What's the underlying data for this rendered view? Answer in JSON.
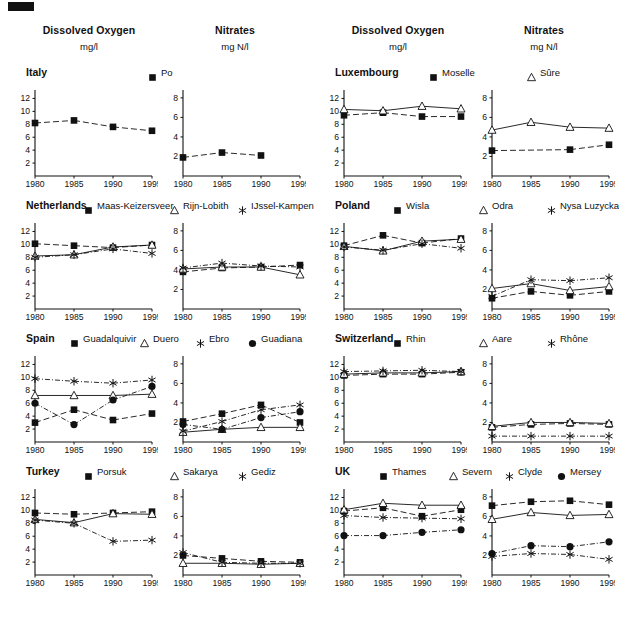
{
  "figure": {
    "corner_mark": "black-bar",
    "x_ticks": [
      "1980",
      "1985",
      "1990",
      "1995"
    ],
    "x_values": [
      1980,
      1985,
      1990,
      1995
    ],
    "do_y_ticks": [
      "2",
      "4",
      "6",
      "8",
      "10",
      "12"
    ],
    "nitrate_y_ticks": [
      "2",
      "4",
      "6",
      "8"
    ]
  },
  "columns": [
    {
      "id": "left",
      "headers": [
        {
          "title": "Dissolved Oxygen",
          "unit": "mg/l"
        },
        {
          "title": "Nitrates",
          "unit": "mg N/l"
        }
      ]
    },
    {
      "id": "right",
      "headers": [
        {
          "title": "Dissolved Oxygen",
          "unit": "mg/l"
        },
        {
          "title": "Nitrates",
          "unit": "mg N/l"
        }
      ]
    }
  ],
  "chart_data": {
    "type": "line",
    "xlabel": "",
    "x": [
      1980,
      1985,
      1990,
      1995
    ],
    "grid": false,
    "legend_position": "top",
    "panels": [
      {
        "country": "Italy",
        "column": "left",
        "row": 0,
        "series_names": [
          "Po"
        ],
        "markers": [
          "square"
        ],
        "dissolved_oxygen": {
          "ylabel": "mg/l",
          "ylim": [
            0,
            13
          ],
          "series": [
            {
              "name": "Po",
              "marker": "square",
              "values": [
                8.2,
                8.6,
                7.6,
                7.0
              ]
            }
          ]
        },
        "nitrates": {
          "ylabel": "mg N/l",
          "ylim": [
            0,
            8.6
          ],
          "series": [
            {
              "name": "Po",
              "marker": "square",
              "values": [
                1.9,
                2.4,
                2.1,
                null
              ]
            }
          ]
        }
      },
      {
        "country": "Netherlands",
        "column": "left",
        "row": 1,
        "series_names": [
          "Maas-Keizersveer",
          "Rijn-Lobith",
          "IJssel-Kampen"
        ],
        "markers": [
          "square",
          "triangle",
          "star"
        ],
        "dissolved_oxygen": {
          "ylabel": "mg/l",
          "ylim": [
            0,
            13
          ],
          "series": [
            {
              "name": "Maas-Keizersveer",
              "marker": "square",
              "values": [
                10.1,
                9.8,
                9.5,
                9.9
              ]
            },
            {
              "name": "Rijn-Lobith",
              "marker": "triangle",
              "values": [
                8.2,
                8.4,
                9.6,
                9.9
              ]
            },
            {
              "name": "IJssel-Kampen",
              "marker": "star",
              "values": [
                8.0,
                8.4,
                9.3,
                8.6
              ]
            }
          ]
        },
        "nitrates": {
          "ylabel": "mg N/l",
          "ylim": [
            0,
            8.6
          ],
          "series": [
            {
              "name": "Maas-Keizersveer",
              "marker": "square",
              "values": [
                3.8,
                4.2,
                4.3,
                4.5
              ]
            },
            {
              "name": "Rijn-Lobith",
              "marker": "triangle",
              "values": [
                4.1,
                4.3,
                4.3,
                3.5
              ]
            },
            {
              "name": "IJssel-Kampen",
              "marker": "star",
              "values": [
                4.2,
                4.7,
                4.4,
                4.3
              ]
            }
          ]
        }
      },
      {
        "country": "Spain",
        "column": "left",
        "row": 2,
        "series_names": [
          "Guadalquivir",
          "Duero",
          "Ebro",
          "Guadiana"
        ],
        "markers": [
          "square",
          "triangle",
          "star",
          "circle"
        ],
        "dissolved_oxygen": {
          "ylabel": "mg/l",
          "ylim": [
            0,
            13
          ],
          "series": [
            {
              "name": "Guadalquivir",
              "marker": "square",
              "values": [
                3.0,
                5.0,
                3.4,
                4.4
              ]
            },
            {
              "name": "Duero",
              "marker": "triangle",
              "values": [
                7.2,
                7.2,
                7.2,
                7.4
              ]
            },
            {
              "name": "Ebro",
              "marker": "star",
              "values": [
                9.8,
                9.4,
                9.1,
                9.6
              ]
            },
            {
              "name": "Guadiana",
              "marker": "circle",
              "values": [
                6.0,
                2.7,
                6.5,
                8.6
              ]
            }
          ]
        },
        "nitrates": {
          "ylabel": "mg N/l",
          "ylim": [
            0,
            8.6
          ],
          "series": [
            {
              "name": "Guadalquivir",
              "marker": "square",
              "values": [
                2.1,
                2.9,
                3.8,
                2.0
              ]
            },
            {
              "name": "Duero",
              "marker": "triangle",
              "values": [
                1.0,
                1.3,
                1.5,
                1.5
              ]
            },
            {
              "name": "Ebro",
              "marker": "star",
              "values": [
                1.1,
                2.1,
                3.3,
                3.8
              ]
            },
            {
              "name": "Guadiana",
              "marker": "circle",
              "values": [
                1.8,
                1.3,
                2.5,
                3.1
              ]
            }
          ]
        }
      },
      {
        "country": "Turkey",
        "column": "left",
        "row": 3,
        "series_names": [
          "Porsuk",
          "Sakarya",
          "Gediz"
        ],
        "markers": [
          "square",
          "triangle",
          "star"
        ],
        "dissolved_oxygen": {
          "ylabel": "mg/l",
          "ylim": [
            0,
            13
          ],
          "series": [
            {
              "name": "Porsuk",
              "marker": "square",
              "values": [
                9.6,
                9.4,
                9.6,
                9.8
              ]
            },
            {
              "name": "Sakarya",
              "marker": "triangle",
              "values": [
                8.6,
                8.1,
                9.5,
                9.4
              ]
            },
            {
              "name": "Gediz",
              "marker": "star",
              "values": [
                8.5,
                8.0,
                5.2,
                5.4
              ]
            }
          ]
        },
        "nitrates": {
          "ylabel": "mg N/l",
          "ylim": [
            0,
            8.6
          ],
          "series": [
            {
              "name": "Porsuk",
              "marker": "square",
              "values": [
                2.0,
                1.7,
                1.4,
                1.3
              ]
            },
            {
              "name": "Sakarya",
              "marker": "triangle",
              "values": [
                1.2,
                1.2,
                1.1,
                1.2
              ]
            },
            {
              "name": "Gediz",
              "marker": "star",
              "values": [
                2.3,
                1.3,
                1.2,
                1.2
              ]
            }
          ]
        }
      },
      {
        "country": "Luxembourg",
        "column": "right",
        "row": 0,
        "series_names": [
          "Moselle",
          "Sûre"
        ],
        "markers": [
          "square",
          "triangle"
        ],
        "dissolved_oxygen": {
          "ylabel": "mg/l",
          "ylim": [
            0,
            13
          ],
          "series": [
            {
              "name": "Moselle",
              "marker": "square",
              "values": [
                9.4,
                9.8,
                9.2,
                9.2
              ]
            },
            {
              "name": "Sûre",
              "marker": "triangle",
              "values": [
                10.3,
                10.1,
                10.8,
                10.4
              ]
            }
          ]
        },
        "nitrates": {
          "ylabel": "mg N/l",
          "ylim": [
            0,
            8.6
          ],
          "series": [
            {
              "name": "Moselle",
              "marker": "square",
              "values": [
                2.6,
                null,
                2.7,
                3.2
              ]
            },
            {
              "name": "Sûre",
              "marker": "triangle",
              "values": [
                4.7,
                5.5,
                5.0,
                4.9
              ]
            }
          ]
        }
      },
      {
        "country": "Poland",
        "column": "right",
        "row": 1,
        "series_names": [
          "Wisla",
          "Odra",
          "Nysa Luzycka"
        ],
        "markers": [
          "square",
          "triangle",
          "star"
        ],
        "dissolved_oxygen": {
          "ylabel": "mg/l",
          "ylim": [
            0,
            13
          ],
          "series": [
            {
              "name": "Wisla",
              "marker": "square",
              "values": [
                9.8,
                11.4,
                10.2,
                10.9
              ]
            },
            {
              "name": "Odra",
              "marker": "triangle",
              "values": [
                9.7,
                9.0,
                10.5,
                10.8
              ]
            },
            {
              "name": "Nysa Luzycka",
              "marker": "star",
              "values": [
                9.6,
                9.1,
                10.1,
                9.4
              ]
            }
          ]
        },
        "nitrates": {
          "ylabel": "mg N/l",
          "ylim": [
            0,
            8.6
          ],
          "series": [
            {
              "name": "Wisla",
              "marker": "square",
              "values": [
                1.1,
                1.8,
                1.4,
                1.8
              ]
            },
            {
              "name": "Odra",
              "marker": "triangle",
              "values": [
                2.1,
                2.6,
                1.9,
                2.3
              ]
            },
            {
              "name": "Nysa Luzycka",
              "marker": "star",
              "values": [
                1.3,
                3.0,
                2.9,
                3.2
              ]
            }
          ]
        }
      },
      {
        "country": "Switzerland",
        "column": "right",
        "row": 2,
        "series_names": [
          "Rhin",
          "Aare",
          "Rhône"
        ],
        "markers": [
          "square",
          "triangle",
          "star"
        ],
        "dissolved_oxygen": {
          "ylabel": "mg/l",
          "ylim": [
            0,
            13
          ],
          "series": [
            {
              "name": "Rhin",
              "marker": "square",
              "values": [
                10.3,
                10.5,
                10.5,
                10.8
              ]
            },
            {
              "name": "Aare",
              "marker": "triangle",
              "values": [
                10.5,
                10.7,
                10.7,
                10.9
              ]
            },
            {
              "name": "Rhône",
              "marker": "star",
              "values": [
                10.9,
                11.0,
                11.1,
                10.9
              ]
            }
          ]
        },
        "nitrates": {
          "ylabel": "mg N/l",
          "ylim": [
            0,
            8.6
          ],
          "series": [
            {
              "name": "Rhin",
              "marker": "square",
              "values": [
                1.5,
                1.8,
                1.9,
                1.8
              ]
            },
            {
              "name": "Aare",
              "marker": "triangle",
              "values": [
                1.6,
                2.0,
                2.0,
                1.9
              ]
            },
            {
              "name": "Rhône",
              "marker": "star",
              "values": [
                0.6,
                0.6,
                0.6,
                0.6
              ]
            }
          ]
        }
      },
      {
        "country": "UK",
        "column": "right",
        "row": 3,
        "series_names": [
          "Thames",
          "Severn",
          "Clyde",
          "Mersey"
        ],
        "markers": [
          "square",
          "triangle",
          "star",
          "circle"
        ],
        "dissolved_oxygen": {
          "ylabel": "mg/l",
          "ylim": [
            0,
            13
          ],
          "series": [
            {
              "name": "Thames",
              "marker": "square",
              "values": [
                9.9,
                10.4,
                9.1,
                10.1
              ]
            },
            {
              "name": "Severn",
              "marker": "triangle",
              "values": [
                10.1,
                11.1,
                10.8,
                10.8
              ]
            },
            {
              "name": "Clyde",
              "marker": "star",
              "values": [
                9.2,
                8.9,
                8.8,
                8.7
              ]
            },
            {
              "name": "Mersey",
              "marker": "circle",
              "values": [
                6.1,
                6.1,
                6.6,
                7.0
              ]
            }
          ]
        },
        "nitrates": {
          "ylabel": "mg N/l",
          "ylim": [
            0,
            8.6
          ],
          "series": [
            {
              "name": "Thames",
              "marker": "square",
              "values": [
                7.1,
                7.5,
                7.6,
                7.2
              ]
            },
            {
              "name": "Severn",
              "marker": "triangle",
              "values": [
                5.7,
                6.4,
                6.1,
                6.2
              ]
            },
            {
              "name": "Clyde",
              "marker": "star",
              "values": [
                1.9,
                2.2,
                2.1,
                1.6
              ]
            },
            {
              "name": "Mersey",
              "marker": "circle",
              "values": [
                2.2,
                3.0,
                2.9,
                3.4
              ]
            }
          ]
        }
      }
    ]
  }
}
